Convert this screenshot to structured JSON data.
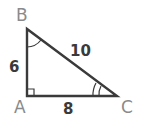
{
  "diagram": {
    "type": "right-triangle",
    "vertices": [
      {
        "id": "B",
        "label": "B"
      },
      {
        "id": "A",
        "label": "A"
      },
      {
        "id": "C",
        "label": "C"
      }
    ],
    "sides": [
      {
        "between": "AB",
        "label": "6"
      },
      {
        "between": "BC",
        "label": "10"
      },
      {
        "between": "AC",
        "label": "8"
      }
    ],
    "angle_marks": {
      "right_angle": "A",
      "single_arc": "B",
      "double_arc": "C"
    },
    "colors": {
      "stroke": "#3a3a3a",
      "vertex_label": "#8a8a8a",
      "side_label": "#3a3a3a",
      "background": "#ffffff"
    }
  }
}
